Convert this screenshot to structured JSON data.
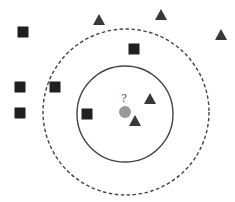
{
  "diagram": {
    "colors": {
      "background": "#ffffff",
      "square": "#1f1f1f",
      "triangle": "#383838",
      "query": "#9a9a9a",
      "inner_circle": "#444444",
      "outer_circle": "#444444",
      "label": "#555555"
    },
    "query_point": {
      "x": 125,
      "y": 112,
      "r": 6,
      "label": "?"
    },
    "inner_circle": {
      "cx": 125,
      "cy": 114,
      "r": 48,
      "style": "solid"
    },
    "outer_circle": {
      "cx": 126,
      "cy": 112,
      "r": 83,
      "style": "dashed"
    },
    "squares": [
      {
        "x": 23,
        "y": 32
      },
      {
        "x": 134,
        "y": 49
      },
      {
        "x": 20,
        "y": 87
      },
      {
        "x": 55,
        "y": 87
      },
      {
        "x": 20,
        "y": 113
      },
      {
        "x": 87,
        "y": 114
      }
    ],
    "triangles": [
      {
        "x": 99,
        "y": 20
      },
      {
        "x": 161,
        "y": 15
      },
      {
        "x": 221,
        "y": 35
      },
      {
        "x": 150,
        "y": 99
      },
      {
        "x": 135,
        "y": 121
      }
    ]
  }
}
